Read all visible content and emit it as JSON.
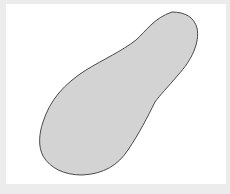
{
  "figure": {
    "colors": {
      "frame": "#ececec",
      "panel": "#ffffff",
      "shape_fill": "#d3d3d3",
      "shape_stroke": "#4a4a4a"
    }
  }
}
